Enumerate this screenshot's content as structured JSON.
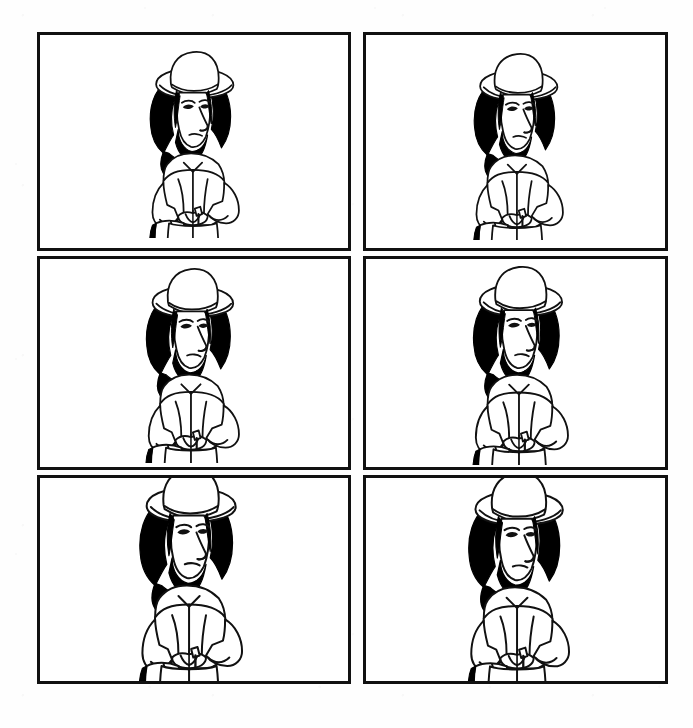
{
  "document": {
    "kind": "scanned-storyboard-sheet",
    "title": "Character Model Sheet",
    "background_color": "#ffffff",
    "ink_color": "#111111",
    "page_width": 693,
    "page_height": 728,
    "columns": 2,
    "rows": 3,
    "panel_count": 6,
    "panel_border_color": "#111111",
    "panel_border_width": 3,
    "grid": {
      "left": 37,
      "top": 32,
      "width": 631,
      "height": 652,
      "column_gap": 12,
      "row_gap": 5
    }
  },
  "character": {
    "name": "hatted-bearded-man",
    "description": "Cartoon figure wearing a wide-brimmed hat, long black hair, beard, large nose, jacket, breeches and boots, holding an open book and a staff",
    "fill_color": "#ffffff",
    "hair_color": "#000000",
    "outline_color": "#111111",
    "parts": [
      "wide-brim-hat",
      "long-black-hair",
      "face",
      "beard",
      "jacket",
      "arms",
      "open-book",
      "staff",
      "breeches",
      "boots"
    ]
  },
  "panels": [
    {
      "id": "panel-1",
      "position": "top-left",
      "row": 1,
      "column": 1,
      "x": 0,
      "y": 0,
      "width": 314,
      "height": 219,
      "figure_scale": 0.92,
      "figure_offset_x": -2,
      "figure_offset_y": -10
    },
    {
      "id": "panel-2",
      "position": "top-right",
      "row": 1,
      "column": 2,
      "x": 326,
      "y": 0,
      "width": 305,
      "height": 219,
      "figure_scale": 0.92,
      "figure_offset_x": 0,
      "figure_offset_y": -8
    },
    {
      "id": "panel-3",
      "position": "middle-left",
      "row": 2,
      "column": 1,
      "x": 0,
      "y": 224,
      "width": 314,
      "height": 214,
      "figure_scale": 0.96,
      "figure_offset_x": -4,
      "figure_offset_y": -4
    },
    {
      "id": "panel-4",
      "position": "middle-right",
      "row": 2,
      "column": 2,
      "x": 326,
      "y": 224,
      "width": 305,
      "height": 214,
      "figure_scale": 0.98,
      "figure_offset_x": 2,
      "figure_offset_y": -2
    },
    {
      "id": "panel-5",
      "position": "bottom-left",
      "row": 3,
      "column": 1,
      "x": 0,
      "y": 443,
      "width": 314,
      "height": 209,
      "figure_scale": 1.06,
      "figure_offset_x": -6,
      "figure_offset_y": 2
    },
    {
      "id": "panel-6",
      "position": "bottom-right",
      "row": 3,
      "column": 2,
      "x": 326,
      "y": 443,
      "width": 305,
      "height": 209,
      "figure_scale": 1.04,
      "figure_offset_x": 0,
      "figure_offset_y": 2
    }
  ]
}
